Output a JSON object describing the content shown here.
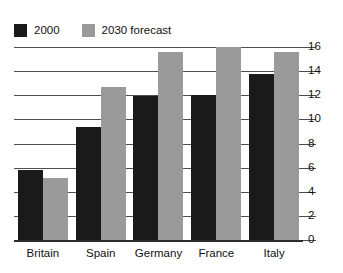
{
  "chart_data": {
    "type": "bar",
    "title": "",
    "subtitle": "",
    "xlabel": "",
    "ylabel": "",
    "categories": [
      "Britain",
      "Spain",
      "Germany",
      "France",
      "Italy"
    ],
    "series": [
      {
        "name": "2000",
        "color": "#1a1a1a",
        "values": [
          5.8,
          9.4,
          11.9,
          12.0,
          13.8
        ]
      },
      {
        "name": "2030 forecast",
        "color": "#9a9a9a",
        "values": [
          5.1,
          12.7,
          15.6,
          16.0,
          15.6
        ]
      }
    ],
    "ylim": [
      0,
      16
    ],
    "ytick_step": 2,
    "yticks": [
      16,
      14,
      12,
      10,
      8,
      6,
      4,
      2,
      0
    ],
    "ytick_labels": [
      "16",
      "14",
      "12",
      "10",
      "8",
      "6",
      "4",
      "2",
      "0"
    ],
    "grid": true,
    "grid_axis": "y",
    "legend_position": "top-left",
    "y_axis_side": "right",
    "annotations": []
  },
  "legend": {
    "entries": [
      {
        "label": "2000",
        "color": "#1a1a1a"
      },
      {
        "label": "2030 forecast",
        "color": "#9a9a9a"
      }
    ]
  },
  "colors": {
    "series_2000": "#1a1a1a",
    "series_2030": "#9a9a9a",
    "gridline": "#4d4d4d",
    "baseline": "#2b2b2b",
    "background": "#ffffff",
    "text": "#111111"
  }
}
